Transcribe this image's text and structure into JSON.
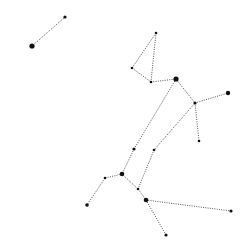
{
  "diagram": {
    "type": "constellation",
    "background": "#ffffff",
    "line_color": "#555555",
    "star_color": "#111111",
    "stars": [
      {
        "id": "s1",
        "x": 32,
        "y": 46,
        "r": 2.6
      },
      {
        "id": "s2",
        "x": 65,
        "y": 17,
        "r": 1.6
      },
      {
        "id": "s3",
        "x": 156,
        "y": 33,
        "r": 1.3
      },
      {
        "id": "s4",
        "x": 132,
        "y": 68,
        "r": 1.3
      },
      {
        "id": "s5",
        "x": 151,
        "y": 82,
        "r": 1.3
      },
      {
        "id": "s6",
        "x": 176,
        "y": 79,
        "r": 2.6
      },
      {
        "id": "s7",
        "x": 195,
        "y": 103,
        "r": 1.6
      },
      {
        "id": "s8",
        "x": 228,
        "y": 93,
        "r": 2.2
      },
      {
        "id": "s9",
        "x": 199,
        "y": 141,
        "r": 1.3
      },
      {
        "id": "s10",
        "x": 134,
        "y": 149,
        "r": 1.6
      },
      {
        "id": "s11",
        "x": 154,
        "y": 150,
        "r": 1.3
      },
      {
        "id": "s12",
        "x": 105,
        "y": 178,
        "r": 1.3
      },
      {
        "id": "s13",
        "x": 122,
        "y": 174,
        "r": 2.3
      },
      {
        "id": "s14",
        "x": 138,
        "y": 189,
        "r": 1.3
      },
      {
        "id": "s15",
        "x": 146,
        "y": 200,
        "r": 2.3
      },
      {
        "id": "s16",
        "x": 87,
        "y": 205,
        "r": 1.8
      },
      {
        "id": "s17",
        "x": 231,
        "y": 211,
        "r": 1.6
      },
      {
        "id": "s18",
        "x": 166,
        "y": 235,
        "r": 1.6
      }
    ],
    "edges": [
      [
        "s1",
        "s2"
      ],
      [
        "s3",
        "s4"
      ],
      [
        "s3",
        "s5"
      ],
      [
        "s4",
        "s5"
      ],
      [
        "s5",
        "s6"
      ],
      [
        "s6",
        "s7"
      ],
      [
        "s7",
        "s8"
      ],
      [
        "s7",
        "s9"
      ],
      [
        "s6",
        "s10"
      ],
      [
        "s10",
        "s13"
      ],
      [
        "s7",
        "s11"
      ],
      [
        "s11",
        "s14"
      ],
      [
        "s13",
        "s12"
      ],
      [
        "s12",
        "s16"
      ],
      [
        "s13",
        "s14"
      ],
      [
        "s14",
        "s15"
      ],
      [
        "s15",
        "s17"
      ],
      [
        "s15",
        "s18"
      ]
    ]
  }
}
